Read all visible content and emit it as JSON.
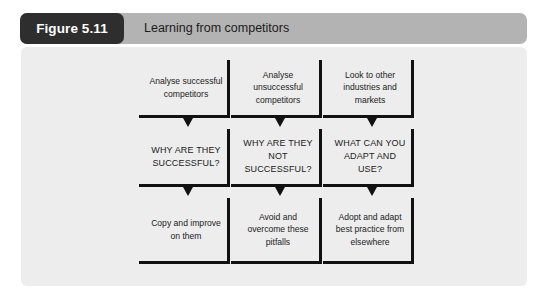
{
  "figure": {
    "badge_label": "Figure 5.11",
    "title": "Learning from competitors",
    "badge_color": "#2e2e2e",
    "header_color": "#b3b3b3",
    "panel_color": "#ededed",
    "line_color": "#111111",
    "text_color": "#1b1b1b"
  },
  "diagram": {
    "type": "flowchart",
    "columns": 3,
    "rows": 3,
    "connector": "arrow-down",
    "columns_data": [
      {
        "name": "successful-competitors",
        "nodes": [
          {
            "text": "Analyse successful competitors",
            "style": "sentence"
          },
          {
            "text": "WHY ARE THEY SUCCESSFUL?",
            "style": "caps"
          },
          {
            "text": "Copy and improve on them",
            "style": "sentence"
          }
        ]
      },
      {
        "name": "unsuccessful-competitors",
        "nodes": [
          {
            "text": "Analyse unsuccessful competitors",
            "style": "sentence"
          },
          {
            "text": "WHY ARE THEY NOT SUCCESSFUL?",
            "style": "caps"
          },
          {
            "text": "Avoid and overcome these pitfalls",
            "style": "sentence"
          }
        ]
      },
      {
        "name": "other-industries",
        "nodes": [
          {
            "text": "Look to other industries and markets",
            "style": "sentence"
          },
          {
            "text": "WHAT CAN YOU ADAPT AND USE?",
            "style": "caps"
          },
          {
            "text": "Adopt and adapt best practice from elsewhere",
            "style": "sentence"
          }
        ]
      }
    ]
  }
}
